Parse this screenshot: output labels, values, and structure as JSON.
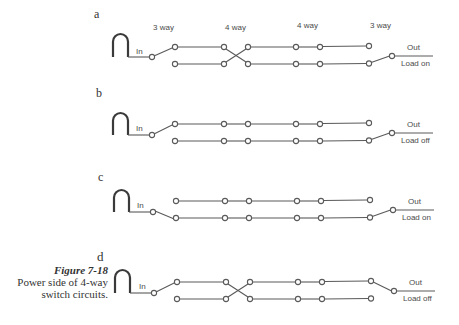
{
  "figure": {
    "number": "Figure 7-18",
    "caption_line1": "Power side of 4-way",
    "caption_line2": "switch circuits."
  },
  "switch_labels": [
    "3 way",
    "4 way",
    "4 way",
    "3 way"
  ],
  "style": {
    "line_color": "#5a5a5a",
    "text_color": "#4a4a4a",
    "arch_color": "#3a3a3a"
  },
  "panels": [
    {
      "id": "a",
      "letter": "a",
      "in_label": "In",
      "out_label": "Out",
      "load_label": "Load on",
      "left_switch": "up",
      "four_way_1": "crossed",
      "four_way_2": "straight",
      "right_switch": "down"
    },
    {
      "id": "b",
      "letter": "b",
      "in_label": "In",
      "out_label": "Out",
      "load_label": "Load off",
      "left_switch": "up",
      "four_way_1": "straight",
      "four_way_2": "straight",
      "right_switch": "down"
    },
    {
      "id": "c",
      "letter": "c",
      "in_label": "In",
      "out_label": "Out",
      "load_label": "Load on",
      "left_switch": "down",
      "four_way_1": "straight",
      "four_way_2": "straight",
      "right_switch": "down"
    },
    {
      "id": "d",
      "letter": "d",
      "in_label": "In",
      "out_label": "Out",
      "load_label": "Load off",
      "left_switch": "up",
      "four_way_1": "crossed",
      "four_way_2": "straight",
      "right_switch": "up"
    }
  ]
}
